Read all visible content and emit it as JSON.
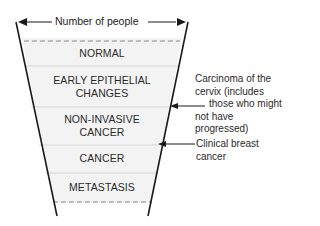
{
  "diagram": {
    "type": "funnel",
    "width_label": "Number of people",
    "stages": [
      {
        "label": "NORMAL"
      },
      {
        "label": "EARLY EPITHELIAL CHANGES",
        "lines": [
          "EARLY EPITHELIAL",
          "CHANGES"
        ]
      },
      {
        "label": "NON-INVASIVE CANCER",
        "lines": [
          "NON-INVASIVE",
          "CANCER"
        ]
      },
      {
        "label": "CANCER"
      },
      {
        "label": "METASTASIS"
      }
    ],
    "annotations": [
      {
        "points_to": "boundary between EARLY EPITHELIAL CHANGES and NON-INVASIVE CANCER",
        "lines": [
          "Carcinoma of the",
          "cervix (includes",
          "those who might",
          "not have",
          "progressed)"
        ]
      },
      {
        "points_to": "boundary between NON-INVASIVE CANCER and CANCER",
        "lines": [
          "Clinical breast",
          "cancer"
        ]
      }
    ],
    "colors": {
      "fill": "#f2f2f2",
      "line": "#1a1a1a",
      "divider": "#d9d9d9"
    }
  }
}
